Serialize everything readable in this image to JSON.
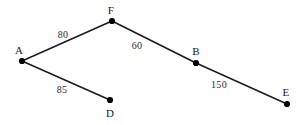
{
  "figure": {
    "background_color": "#ffffff",
    "line_color": "#1a1a1a",
    "node_color": "#000000",
    "width": 303,
    "height": 125
  },
  "chart_data": {
    "type": "diagram",
    "subtype": "node-link-graph",
    "title": "",
    "xlabel": "",
    "ylabel": "",
    "grid": false,
    "legend": null,
    "nodes": [
      {
        "id": "A",
        "label": "A",
        "x": 22,
        "y": 61,
        "label_x": 19,
        "label_y": 50
      },
      {
        "id": "F",
        "label": "F",
        "x": 112,
        "y": 21,
        "label_x": 111,
        "label_y": 10
      },
      {
        "id": "B",
        "label": "B",
        "x": 196,
        "y": 63,
        "label_x": 196,
        "label_y": 51
      },
      {
        "id": "E",
        "label": "E",
        "x": 287,
        "y": 104,
        "label_x": 286,
        "label_y": 92
      },
      {
        "id": "D",
        "label": "D",
        "x": 110,
        "y": 100,
        "label_x": 110,
        "label_y": 113
      }
    ],
    "edges": [
      {
        "from": "A",
        "to": "F",
        "weight": "80",
        "label_x": 63,
        "label_y": 35
      },
      {
        "from": "F",
        "to": "B",
        "weight": "60",
        "label_x": 137,
        "label_y": 46
      },
      {
        "from": "B",
        "to": "E",
        "weight": "150",
        "label_x": 219,
        "label_y": 85
      },
      {
        "from": "A",
        "to": "D",
        "weight": "85",
        "label_x": 62,
        "label_y": 90
      }
    ]
  }
}
